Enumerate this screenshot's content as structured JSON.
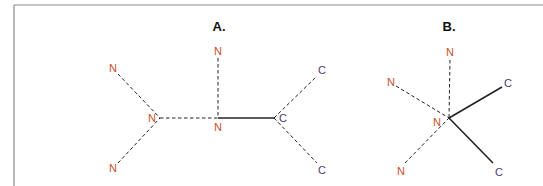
{
  "colors": {
    "frame": "#8a8a8a",
    "nitrogen": "#c8502a",
    "carbon": "#4a3a7a",
    "bond": "#222222"
  },
  "panels": [
    {
      "label": "A.",
      "label_pos": [
        219,
        31
      ],
      "center_atoms": [
        {
          "symbol": "N",
          "pos": [
            160,
            118
          ],
          "text_pos": [
            152,
            122
          ],
          "element": "nitrogen"
        },
        {
          "symbol": "N",
          "pos": [
            218,
            118
          ],
          "text_pos": [
            218,
            131
          ],
          "element": "nitrogen"
        },
        {
          "symbol": "C",
          "pos": [
            274,
            118
          ],
          "text_pos": [
            283,
            122
          ],
          "element": "carbon"
        }
      ],
      "outer_atoms": [
        {
          "symbol": "N",
          "pos": [
            113,
            70
          ],
          "text_pos": [
            113,
            72
          ],
          "element": "nitrogen"
        },
        {
          "symbol": "N",
          "pos": [
            113,
            168
          ],
          "text_pos": [
            113,
            172
          ],
          "element": "nitrogen"
        },
        {
          "symbol": "N",
          "pos": [
            218,
            50
          ],
          "text_pos": [
            218,
            55
          ],
          "element": "nitrogen"
        },
        {
          "symbol": "C",
          "pos": [
            322,
            70
          ],
          "text_pos": [
            322,
            74
          ],
          "element": "carbon"
        },
        {
          "symbol": "C",
          "pos": [
            322,
            168
          ],
          "text_pos": [
            322,
            174
          ],
          "element": "carbon"
        }
      ],
      "bonds": [
        {
          "from": [
            118,
            74
          ],
          "to": [
            160,
            118
          ],
          "style": "dashed"
        },
        {
          "from": [
            118,
            163
          ],
          "to": [
            160,
            118
          ],
          "style": "dashed"
        },
        {
          "from": [
            160,
            118
          ],
          "to": [
            218,
            118
          ],
          "style": "dashed"
        },
        {
          "from": [
            218,
            58
          ],
          "to": [
            218,
            118
          ],
          "style": "dashed"
        },
        {
          "from": [
            218,
            118
          ],
          "to": [
            274,
            118
          ],
          "style": "solid"
        },
        {
          "from": [
            274,
            118
          ],
          "to": [
            317,
            76
          ],
          "style": "dashed"
        },
        {
          "from": [
            274,
            118
          ],
          "to": [
            317,
            163
          ],
          "style": "dashed"
        }
      ]
    },
    {
      "label": "B.",
      "label_pos": [
        449,
        31
      ],
      "center_atoms": [
        {
          "symbol": "N",
          "pos": [
            449,
            118
          ],
          "text_pos": [
            437,
            126
          ],
          "element": "nitrogen"
        }
      ],
      "outer_atoms": [
        {
          "symbol": "N",
          "pos": [
            450,
            52
          ],
          "text_pos": [
            450,
            56
          ],
          "element": "nitrogen"
        },
        {
          "symbol": "N",
          "pos": [
            391,
            82
          ],
          "text_pos": [
            391,
            86
          ],
          "element": "nitrogen"
        },
        {
          "symbol": "N",
          "pos": [
            401,
            170
          ],
          "text_pos": [
            401,
            175
          ],
          "element": "nitrogen"
        },
        {
          "symbol": "C",
          "pos": [
            508,
            83
          ],
          "text_pos": [
            508,
            87
          ],
          "element": "carbon"
        },
        {
          "symbol": "C",
          "pos": [
            499,
            171
          ],
          "text_pos": [
            499,
            176
          ],
          "element": "carbon"
        }
      ],
      "bonds": [
        {
          "from": [
            450,
            60
          ],
          "to": [
            449,
            118
          ],
          "style": "dashed"
        },
        {
          "from": [
            396,
            86
          ],
          "to": [
            449,
            118
          ],
          "style": "dashed"
        },
        {
          "from": [
            405,
            163
          ],
          "to": [
            449,
            118
          ],
          "style": "dashed"
        },
        {
          "from": [
            449,
            118
          ],
          "to": [
            502,
            87
          ],
          "style": "solid"
        },
        {
          "from": [
            449,
            118
          ],
          "to": [
            493,
            163
          ],
          "style": "solid"
        }
      ]
    }
  ]
}
